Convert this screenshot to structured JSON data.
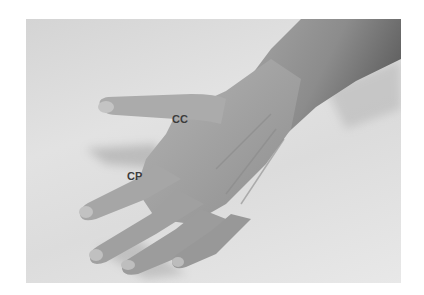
{
  "image": {
    "description": "Grayscale photograph of the back of a right hand resting on a light surface, with two anatomical labels",
    "colors": {
      "background": "#ffffff",
      "surface": "#dedede",
      "skin_light": "#b8b8b8",
      "skin_mid": "#9a9a9a",
      "skin_dark": "#6e6e6e",
      "label_text": "#3c3c3c"
    }
  },
  "labels": [
    {
      "id": "cc",
      "text": "CC"
    },
    {
      "id": "cp",
      "text": "CP"
    }
  ]
}
